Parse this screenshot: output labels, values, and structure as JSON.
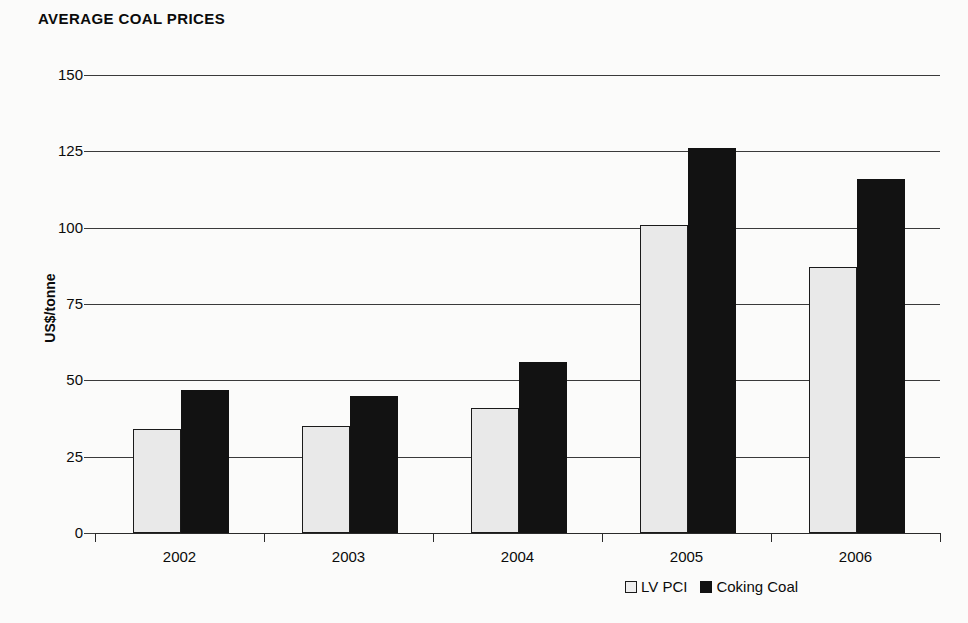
{
  "chart_data": {
    "type": "bar",
    "title": "AVERAGE COAL PRICES",
    "xlabel": "",
    "ylabel": "US$/tonne",
    "categories": [
      "2002",
      "2003",
      "2004",
      "2005",
      "2006"
    ],
    "series": [
      {
        "name": "LV PCI",
        "values": [
          34,
          35,
          41,
          101,
          87
        ],
        "color": "#e9e9e9"
      },
      {
        "name": "Coking Coal",
        "values": [
          47,
          45,
          56,
          126,
          116
        ],
        "color": "#121212"
      }
    ],
    "ylim": [
      0,
      150
    ],
    "ytick_values": [
      0,
      25,
      50,
      75,
      100,
      125,
      150
    ],
    "ytick_labels": [
      "0",
      "25",
      "50",
      "75",
      "100",
      "125",
      "150"
    ],
    "grid": true,
    "legend_position": "bottom-right"
  },
  "legend": {
    "entries": [
      {
        "label": "LV PCI",
        "swatch": "light-square-swatch"
      },
      {
        "label": "Coking Coal",
        "swatch": "dark-square-swatch"
      }
    ]
  }
}
